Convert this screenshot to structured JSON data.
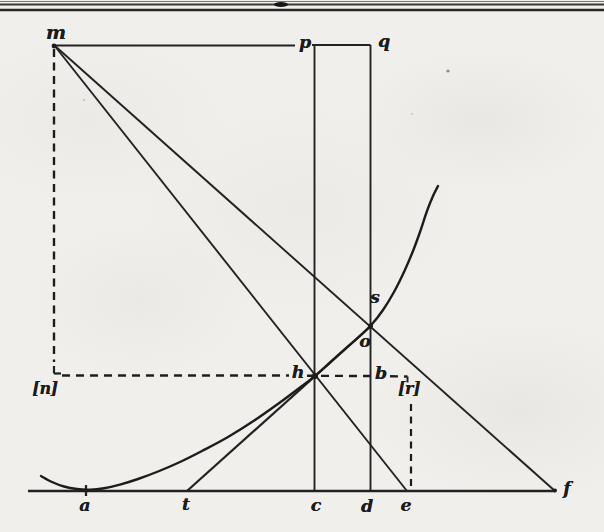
{
  "page": {
    "background": "#f1efec",
    "ink": "#1f1f1f"
  },
  "figure": {
    "labels": [
      {
        "name": "m",
        "text": "m",
        "x": 56,
        "y": 32,
        "style": "big"
      },
      {
        "name": "p",
        "text": "p",
        "x": 305,
        "y": 43,
        "style": ""
      },
      {
        "name": "q",
        "text": "q",
        "x": 384,
        "y": 42,
        "style": ""
      },
      {
        "name": "s",
        "text": "s",
        "x": 375,
        "y": 298,
        "style": ""
      },
      {
        "name": "o",
        "text": "o",
        "x": 365,
        "y": 342,
        "style": ""
      },
      {
        "name": "h",
        "text": "h",
        "x": 298,
        "y": 373,
        "style": ""
      },
      {
        "name": "b",
        "text": "b",
        "x": 381,
        "y": 374,
        "style": ""
      },
      {
        "name": "n",
        "text": "[n]",
        "x": 45,
        "y": 389,
        "style": "bracketed"
      },
      {
        "name": "r",
        "text": "[r]",
        "x": 409,
        "y": 389,
        "style": "bracketed"
      },
      {
        "name": "a",
        "text": "a",
        "x": 85,
        "y": 506,
        "style": ""
      },
      {
        "name": "t",
        "text": "t",
        "x": 186,
        "y": 505,
        "style": ""
      },
      {
        "name": "c",
        "text": "c",
        "x": 316,
        "y": 506,
        "style": ""
      },
      {
        "name": "d",
        "text": "d",
        "x": 367,
        "y": 507,
        "style": ""
      },
      {
        "name": "e",
        "text": "e",
        "x": 406,
        "y": 506,
        "style": ""
      },
      {
        "name": "f",
        "text": "f",
        "x": 567,
        "y": 489,
        "style": ""
      }
    ],
    "solid_lines": [
      {
        "name": "top-rule-thin",
        "x1": 0,
        "y1": 1.5,
        "x2": 604,
        "y2": 1.5,
        "w": 1.2,
        "color": "#7a7772"
      },
      {
        "name": "top-rule-mid",
        "x1": 0,
        "y1": 4.5,
        "x2": 604,
        "y2": 4.5,
        "w": 1.8,
        "color": "#3a3835"
      },
      {
        "name": "top-rule-thick",
        "x1": 0,
        "y1": 10,
        "x2": 604,
        "y2": 10,
        "w": 2.6,
        "color": "#262524"
      },
      {
        "name": "horizontal-m-p",
        "x1": 54,
        "y1": 45.5,
        "x2": 295,
        "y2": 45.5,
        "w": 2.2,
        "color": "#222"
      },
      {
        "name": "horizontal-p-q",
        "x1": 312,
        "y1": 45,
        "x2": 370.5,
        "y2": 45,
        "w": 2.2,
        "color": "#222"
      },
      {
        "name": "vertical-p-c",
        "x1": 314.5,
        "y1": 45,
        "x2": 314.5,
        "y2": 491,
        "w": 1.9,
        "color": "#222"
      },
      {
        "name": "vertical-q-d",
        "x1": 370.5,
        "y1": 45,
        "x2": 370.5,
        "y2": 491,
        "w": 1.9,
        "color": "#222"
      },
      {
        "name": "baseline-axis",
        "x1": 28,
        "y1": 491,
        "x2": 555,
        "y2": 491,
        "w": 2.3,
        "color": "#222"
      },
      {
        "name": "line-m-h-e",
        "x1": 54,
        "y1": 45,
        "x2": 407,
        "y2": 491,
        "w": 1.9,
        "color": "#222"
      },
      {
        "name": "line-m-s-f",
        "x1": 54,
        "y1": 45,
        "x2": 555,
        "y2": 491,
        "w": 1.9,
        "color": "#222"
      },
      {
        "name": "tangent-t-h-o",
        "x1": 187,
        "y1": 491,
        "x2": 371.5,
        "y2": 325.5,
        "w": 2.2,
        "color": "#222"
      },
      {
        "name": "tick-a",
        "x1": 86,
        "y1": 485,
        "x2": 86,
        "y2": 496,
        "w": 2.3,
        "color": "#222"
      },
      {
        "name": "corner-n",
        "x1": 54,
        "y1": 366,
        "x2": 54,
        "y2": 373.5,
        "w": 2.2,
        "color": "#222"
      },
      {
        "name": "corner-n-foot",
        "x1": 54,
        "y1": 373.5,
        "x2": 61,
        "y2": 373.5,
        "w": 2.2,
        "color": "#222"
      },
      {
        "name": "corner-r-hook",
        "x1": 407.5,
        "y1": 376.5,
        "x2": 407.5,
        "y2": 382.5,
        "w": 2.0,
        "color": "#222"
      }
    ],
    "dashed_lines": [
      {
        "name": "dashed-m-n",
        "x1": 54,
        "y1": 49,
        "x2": 54,
        "y2": 362,
        "w": 2.4,
        "dash": "8 5.5"
      },
      {
        "name": "dashed-n-h",
        "x1": 62,
        "y1": 375.5,
        "x2": 289,
        "y2": 375.5,
        "w": 2.4,
        "dash": "8 6"
      },
      {
        "name": "dashed-h-b",
        "x1": 307,
        "y1": 375.8,
        "x2": 373,
        "y2": 376,
        "w": 2.4,
        "dash": "8 6"
      },
      {
        "name": "dashed-b-r",
        "x1": 390,
        "y1": 376.3,
        "x2": 407.5,
        "y2": 376.5,
        "w": 2.4,
        "dash": "8 6"
      },
      {
        "name": "dashed-r-e",
        "x1": 411,
        "y1": 404,
        "x2": 411,
        "y2": 489,
        "w": 2.2,
        "dash": "7 5.5"
      }
    ],
    "curve": {
      "name": "main-curve",
      "width": 2.4,
      "points": [
        [
          41,
          476
        ],
        [
          52,
          482
        ],
        [
          64,
          486.5
        ],
        [
          77,
          489
        ],
        [
          90,
          489.6
        ],
        [
          104,
          488.2
        ],
        [
          120,
          484.6
        ],
        [
          138,
          479
        ],
        [
          158,
          471.5
        ],
        [
          180,
          462
        ],
        [
          202,
          451
        ],
        [
          228,
          437
        ],
        [
          255,
          420
        ],
        [
          282,
          401
        ],
        [
          300,
          387.5
        ],
        [
          315,
          375.8
        ],
        [
          330,
          362.5
        ],
        [
          344,
          350
        ],
        [
          358,
          337.6
        ],
        [
          371,
          325.3
        ],
        [
          383,
          310
        ],
        [
          394,
          292
        ],
        [
          404,
          272
        ],
        [
          413,
          251
        ],
        [
          420,
          232
        ],
        [
          427,
          211
        ],
        [
          433,
          196
        ],
        [
          438,
          186
        ]
      ]
    },
    "dots": [
      {
        "name": "junction-m",
        "x": 54,
        "y": 46,
        "r": 2.4
      },
      {
        "name": "junction-h",
        "x": 315,
        "y": 376,
        "r": 3.0
      },
      {
        "name": "junction-o-s",
        "x": 370.5,
        "y": 326,
        "r": 2.5
      },
      {
        "name": "junction-f",
        "x": 555,
        "y": 490.5,
        "r": 2.0
      }
    ],
    "ornaments": {
      "rule_blob": {
        "x": 281,
        "y": 4.5,
        "rx": 7,
        "ry": 2.4
      },
      "specks": [
        {
          "x": 448,
          "y": 71,
          "r": 1.6,
          "o": 0.65
        },
        {
          "x": 84,
          "y": 100,
          "r": 1.1,
          "o": 0.3
        },
        {
          "x": 412,
          "y": 114,
          "r": 1.0,
          "o": 0.25
        }
      ]
    }
  }
}
